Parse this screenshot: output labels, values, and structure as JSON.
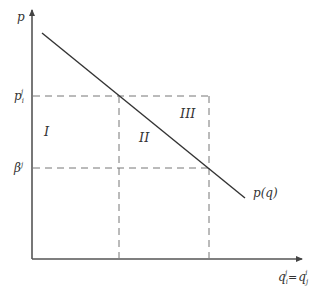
{
  "diagram": {
    "type": "price-quantity",
    "colors": {
      "axis": "#555555",
      "curve": "#333333",
      "dashed": "#777777",
      "text": "#333333"
    },
    "axes": {
      "y_label": "p",
      "x_label_main": "q",
      "x_label_sub_left": "i",
      "x_label_sup_left": "j",
      "x_label_eq": "=",
      "x_label_sub_right": "j",
      "x_label_sup_right": "i"
    },
    "y_ticks": [
      {
        "base": "p",
        "sub": "i",
        "sup": "j"
      },
      {
        "base": "β",
        "sub": "",
        "sup": "j"
      }
    ],
    "curve_label": "p(q)",
    "regions": [
      "I",
      "II",
      "III"
    ]
  }
}
